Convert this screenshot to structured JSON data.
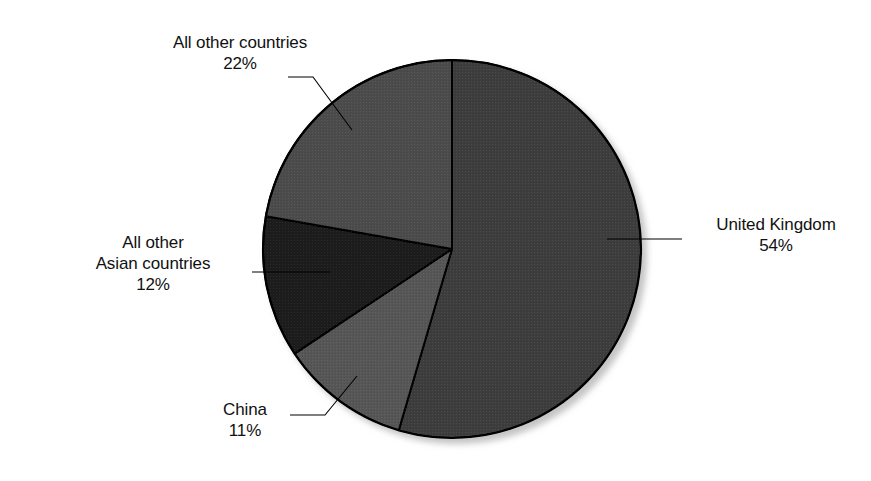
{
  "chart_data": {
    "type": "pie",
    "title": "",
    "subtitle": "",
    "xlabel": "",
    "ylabel": "",
    "legend_position": "none",
    "grid": false,
    "units": "percent",
    "categories": [
      "United Kingdom",
      "China",
      "All other Asian countries",
      "All other countries"
    ],
    "values": [
      54,
      11,
      12,
      22
    ],
    "slices": [
      {
        "name": "United Kingdom",
        "value": 54,
        "value_label": "54%",
        "color": "#3d3d3d",
        "start_angle_deg": 0,
        "end_angle_deg": 194.4
      },
      {
        "name": "China",
        "value": 11,
        "value_label": "11%",
        "color": "#565656",
        "start_angle_deg": 194.4,
        "end_angle_deg": 234.0
      },
      {
        "name": "All other Asian countries",
        "value": 12,
        "value_label": "12%",
        "color": "#1c1c1c",
        "start_angle_deg": 234.0,
        "end_angle_deg": 277.2
      },
      {
        "name": "All other countries",
        "value": 22,
        "value_label": "22%",
        "color": "#4b4b4b",
        "start_angle_deg": 277.2,
        "end_angle_deg": 360.0
      }
    ]
  },
  "labels": {
    "other_countries": {
      "line1": "All other countries",
      "line2": "22%"
    },
    "asian_countries": {
      "line1": "All other",
      "line2": "Asian countries",
      "line3": "12%"
    },
    "china": {
      "line1": "China",
      "line2": "11%"
    },
    "united_kingdom": {
      "line1": "United Kingdom",
      "line2": "54%"
    }
  },
  "colors": {
    "background": "#ffffff",
    "outline": "#000000",
    "leader_line": "#000000",
    "text": "#111111",
    "slice_uk": "#3d3d3d",
    "slice_china": "#565656",
    "slice_asian": "#1c1c1c",
    "slice_other": "#4b4b4b"
  }
}
